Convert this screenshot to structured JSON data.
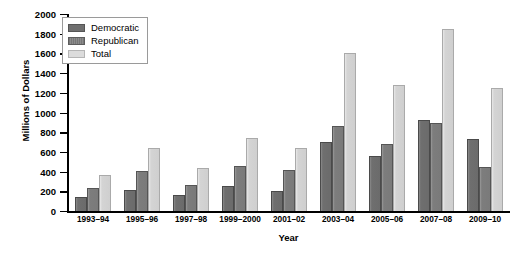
{
  "chart_data": {
    "type": "bar",
    "title": "",
    "xlabel": "Year",
    "ylabel": "Millions of Dollars",
    "ylim": [
      0,
      2000
    ],
    "ytick_step": 200,
    "yticks": [
      0,
      200,
      400,
      600,
      800,
      1000,
      1200,
      1400,
      1600,
      1800,
      2000
    ],
    "grid": false,
    "legend_position": "top-left",
    "categories": [
      "1993–94",
      "1995–96",
      "1997–98",
      "1999–2000",
      "2001–02",
      "2003–04",
      "2005–06",
      "2007–08",
      "2009–10"
    ],
    "series": [
      {
        "name": "Democratic",
        "color": "#6f6f6f",
        "values": [
          140,
          210,
          160,
          255,
          200,
          700,
          555,
          925,
          735
        ]
      },
      {
        "name": "Republican",
        "color": "#7d7d7d",
        "values": [
          230,
          410,
          265,
          455,
          415,
          865,
          680,
          890,
          450
        ]
      },
      {
        "name": "Total",
        "color": "#d4d4d4",
        "values": [
          365,
          640,
          435,
          740,
          640,
          1600,
          1275,
          1845,
          1250
        ]
      }
    ]
  }
}
